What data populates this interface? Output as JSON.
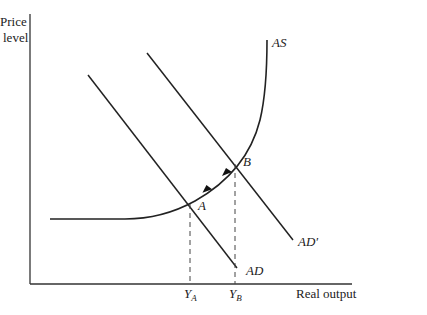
{
  "diagram": {
    "type": "AS-AD macroeconomic diagram",
    "y_axis_label_line1": "Price",
    "y_axis_label_line2": "level",
    "x_axis_label": "Real output",
    "curves": {
      "as_label": "AS",
      "ad_label": "AD",
      "ad_prime_label": "AD′"
    },
    "points": {
      "a_label": "A",
      "b_label": "B"
    },
    "ticks": {
      "ya_main": "Y",
      "ya_sub": "A",
      "yb_main": "Y",
      "yb_sub": "B"
    },
    "colors": {
      "line": "#222222",
      "dash": "#444444"
    }
  }
}
